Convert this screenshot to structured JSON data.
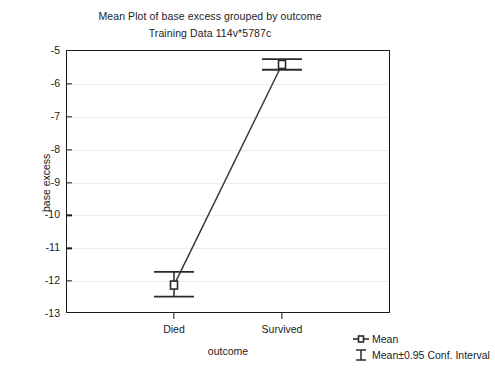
{
  "chart_data": {
    "type": "line",
    "title": "Mean Plot of base excess grouped by outcome",
    "subtitle": "Training Data 114v*5787c",
    "xlabel": "outcome",
    "ylabel": "base excess",
    "categories": [
      "Died",
      "Survived"
    ],
    "values": [
      -12.15,
      -5.44
    ],
    "error_low": [
      -12.5,
      -5.6
    ],
    "error_high": [
      -11.75,
      -5.28
    ],
    "ylim": [
      -13,
      -5
    ],
    "yticks": [
      "-5",
      "-6",
      "-7",
      "-8",
      "-9",
      "-10",
      "-11",
      "-12",
      "-13"
    ],
    "ytick_values": [
      -5,
      -6,
      -7,
      -8,
      -9,
      -10,
      -11,
      -12,
      -13
    ],
    "grid": true,
    "legend_position": "bottom-right",
    "legend": [
      {
        "marker": "mean-marker-icon",
        "label": "Mean"
      },
      {
        "marker": "conf-interval-icon",
        "label": "Mean±0.95 Conf. Interval"
      }
    ],
    "series": [
      {
        "name": "Mean",
        "values": [
          -12.15,
          -5.44
        ]
      }
    ],
    "colors": {
      "line": "#3a3a3a",
      "marker": "#2b2b2b",
      "grid": "#ededed",
      "axis": "#1a1a1a",
      "background": "#ffffff"
    }
  }
}
